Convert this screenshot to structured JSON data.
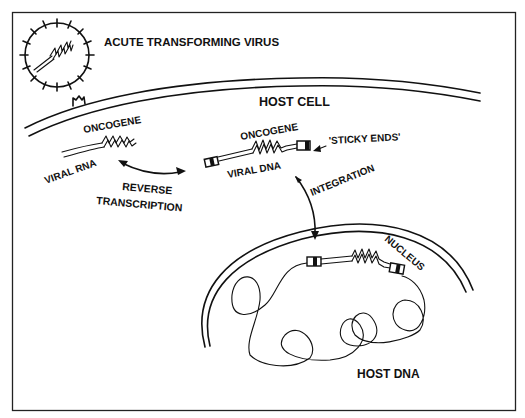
{
  "diagram": {
    "labels": {
      "virus": "ACUTE TRANSFORMING VIRUS",
      "host_cell": "HOST CELL",
      "oncogene_rna": "ONCOGENE",
      "viral_rna": "VIRAL RNA",
      "reverse": "REVERSE",
      "transcription": "TRANSCRIPTION",
      "oncogene_dna": "ONCOGENE",
      "viral_dna": "VIRAL DNA",
      "sticky_ends": "'STICKY ENDS'",
      "integration": "INTEGRATION",
      "nucleus": "NUCLEUS",
      "host_dna": "HOST DNA"
    },
    "colors": {
      "ink": "#111111",
      "background": "#ffffff"
    }
  }
}
